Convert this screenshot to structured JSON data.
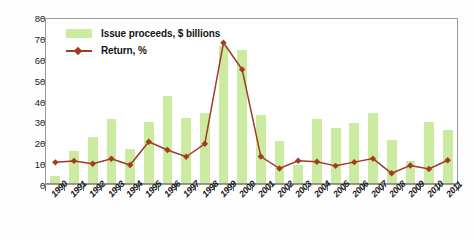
{
  "chart_data": {
    "type": "bar",
    "title": "",
    "subtitle": "",
    "xlabel": "",
    "ylabel": "",
    "ylim": [
      0,
      80
    ],
    "yticks": [
      0,
      10,
      20,
      30,
      40,
      50,
      60,
      70,
      80
    ],
    "grid": false,
    "legend_position": "top-left",
    "categories": [
      "1990",
      "1991",
      "1992",
      "1993",
      "1994",
      "1995",
      "1996",
      "1997",
      "1998",
      "1999",
      "2000",
      "2001",
      "2002",
      "2003",
      "2004",
      "2005",
      "2006",
      "2007",
      "2008",
      "2009",
      "2010",
      "2011"
    ],
    "series": [
      {
        "name": "Issue proceeds, $ billions",
        "type": "bar",
        "color": "#cbeba0",
        "values": [
          4,
          16,
          22.5,
          31,
          17,
          29.5,
          42,
          31.5,
          34,
          66,
          64,
          33,
          20.5,
          9,
          31,
          27,
          29,
          34,
          21,
          11,
          29.5,
          26
        ]
      },
      {
        "name": "Return, %",
        "type": "line",
        "color": "#a33a24",
        "marker": "diamond",
        "values": [
          10.5,
          11.2,
          9.8,
          12.2,
          9.2,
          20.5,
          16.5,
          13.2,
          19.5,
          68.5,
          55.5,
          13.3,
          7.5,
          11.3,
          10.8,
          8.8,
          10.6,
          12.3,
          5.2,
          9.0,
          7.3,
          11.5
        ]
      }
    ]
  },
  "legend": {
    "items": [
      {
        "label": "Issue proceeds, $ billions",
        "swatch": "bar-swatch",
        "color": "#cbeba0"
      },
      {
        "label": "Return, %",
        "swatch": "line-swatch",
        "color": "#a33a24"
      }
    ]
  },
  "colors": {
    "bar": "#cbeba0",
    "line": "#a33a24",
    "axis": "#8f8f8f",
    "text": "#1a1a1a",
    "background": "#ffffff"
  }
}
